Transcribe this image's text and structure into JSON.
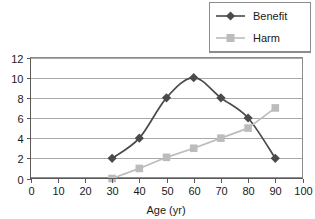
{
  "chart_data": {
    "type": "line",
    "title": "",
    "xlabel": "Age (yr)",
    "ylabel": "",
    "x": [
      30,
      40,
      50,
      60,
      70,
      80,
      90
    ],
    "xlim": [
      0,
      100
    ],
    "ylim": [
      0,
      12
    ],
    "xticks": [
      0,
      10,
      20,
      30,
      40,
      50,
      60,
      70,
      80,
      90,
      100
    ],
    "yticks": [
      0,
      2,
      4,
      6,
      8,
      10,
      12
    ],
    "grid": "horizontal",
    "legend_position": "top-right",
    "series": [
      {
        "name": "Benefit",
        "values": [
          2,
          4,
          8,
          10,
          8,
          6,
          2
        ],
        "color": "#4a4a4a",
        "marker": "diamond",
        "smooth": true
      },
      {
        "name": "Harm",
        "values": [
          0,
          1,
          2.1,
          3,
          4,
          5,
          7
        ],
        "color": "#bcbcbc",
        "marker": "square",
        "smooth": false
      }
    ]
  },
  "axes": {
    "x_tick_labels": [
      "0",
      "10",
      "20",
      "30",
      "40",
      "50",
      "60",
      "70",
      "80",
      "90",
      "100"
    ],
    "y_tick_labels": [
      "0",
      "2",
      "4",
      "6",
      "8",
      "10",
      "12"
    ],
    "x_axis_title": "Age (yr)"
  },
  "legend": {
    "entries": [
      {
        "label": "Benefit",
        "marker": "diamond-marker",
        "color": "#4a4a4a"
      },
      {
        "label": "Harm",
        "marker": "square-marker",
        "color": "#bcbcbc"
      }
    ]
  },
  "colors": {
    "benefit": "#4a4a4a",
    "harm": "#bcbcbc",
    "gridline": "#a8a8a8",
    "frame": "#8c8c8c",
    "text": "#1a1a1a",
    "background": "#ffffff"
  }
}
